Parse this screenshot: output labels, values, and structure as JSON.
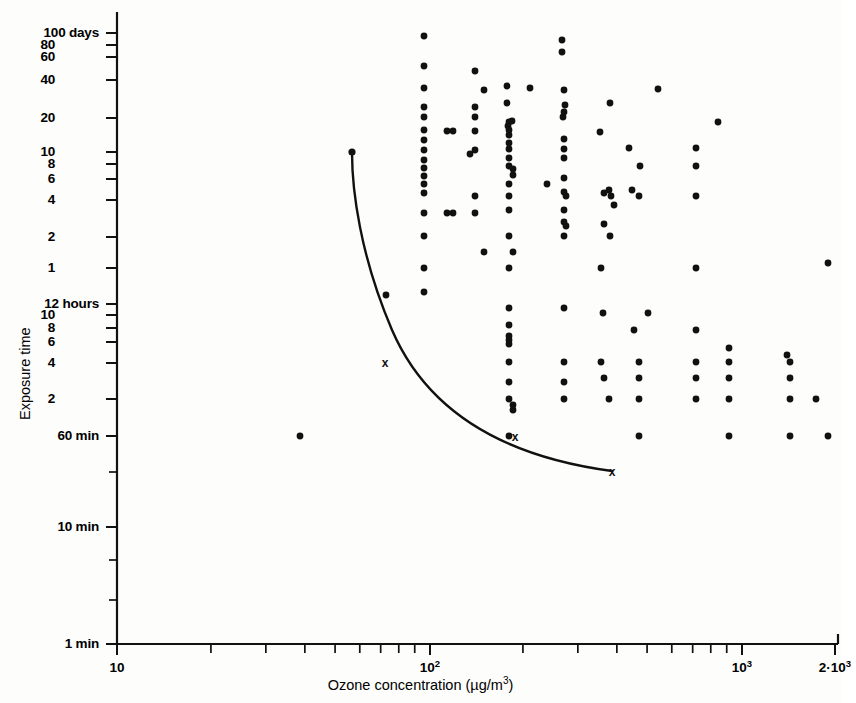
{
  "chart_data": {
    "type": "scatter",
    "title": "",
    "xlabel": "Ozone concentration (µg/m³)",
    "ylabel": "Exposure time",
    "x_scale": "log",
    "y_scale": "log",
    "xlim": [
      10,
      2000
    ],
    "grid": false,
    "legend": null,
    "x_tick_labels": [
      {
        "value": 10,
        "text": "10",
        "px": 117
      },
      {
        "value": 100,
        "text": "10",
        "sup": "2",
        "px": 430
      },
      {
        "value": 1000,
        "text": "10",
        "sup": "3",
        "px": 742
      },
      {
        "value": 2000,
        "text": "2·10",
        "sup": "3",
        "px": 835
      }
    ],
    "x_minor_ticks": [
      20,
      30,
      40,
      50,
      60,
      70,
      80,
      90,
      200,
      300,
      400,
      500,
      600,
      700,
      800,
      900,
      2000
    ],
    "y_tick_labels": [
      {
        "text": "100",
        "unit": " days",
        "px": 33
      },
      {
        "text": "80",
        "unit": "",
        "px": 45
      },
      {
        "text": "60",
        "unit": "",
        "px": 57
      },
      {
        "text": "40",
        "unit": "",
        "px": 80
      },
      {
        "text": "20",
        "unit": "",
        "px": 118
      },
      {
        "text": "10",
        "unit": "",
        "px": 152
      },
      {
        "text": "8",
        "unit": "",
        "px": 164
      },
      {
        "text": "6",
        "unit": "",
        "px": 179
      },
      {
        "text": "4",
        "unit": "",
        "px": 200
      },
      {
        "text": "2",
        "unit": "",
        "px": 237
      },
      {
        "text": "1",
        "unit": "",
        "px": 268
      },
      {
        "text": "12",
        "unit": " hours",
        "px": 304
      },
      {
        "text": "10",
        "unit": "",
        "px": 315
      },
      {
        "text": "8",
        "unit": "",
        "px": 328
      },
      {
        "text": "6",
        "unit": "",
        "px": 342
      },
      {
        "text": "4",
        "unit": "",
        "px": 363
      },
      {
        "text": "2",
        "unit": "",
        "px": 399
      },
      {
        "text": "60",
        "unit": " min",
        "px": 436
      },
      {
        "text": "10",
        "unit": " min",
        "px": 527
      },
      {
        "text": "1",
        "unit": " min",
        "px": 644
      }
    ],
    "y_minor_ticks_px": [
      472,
      560,
      600
    ],
    "axes_px": {
      "x_origin": 117,
      "y_bottom": 644,
      "y_top": 12,
      "x_right": 838
    },
    "points_px": [
      [
        424,
        36
      ],
      [
        562,
        40
      ],
      [
        562,
        52
      ],
      [
        424,
        66
      ],
      [
        475,
        71
      ],
      [
        507,
        86
      ],
      [
        424,
        88
      ],
      [
        530,
        88
      ],
      [
        658,
        89
      ],
      [
        484,
        90
      ],
      [
        564,
        90
      ],
      [
        424,
        107
      ],
      [
        475,
        107
      ],
      [
        507,
        103
      ],
      [
        610,
        103
      ],
      [
        565,
        105
      ],
      [
        424,
        117
      ],
      [
        475,
        117
      ],
      [
        563,
        117
      ],
      [
        564,
        112
      ],
      [
        508,
        126
      ],
      [
        509,
        122
      ],
      [
        475,
        131
      ],
      [
        512,
        121
      ],
      [
        424,
        130
      ],
      [
        447,
        131
      ],
      [
        453,
        131
      ],
      [
        509,
        135
      ],
      [
        509,
        130
      ],
      [
        424,
        140
      ],
      [
        509,
        143
      ],
      [
        564,
        139
      ],
      [
        600,
        132
      ],
      [
        718,
        122
      ],
      [
        424,
        150
      ],
      [
        475,
        150
      ],
      [
        509,
        149
      ],
      [
        564,
        149
      ],
      [
        629,
        148
      ],
      [
        696,
        148
      ],
      [
        424,
        160
      ],
      [
        424,
        168
      ],
      [
        424,
        176
      ],
      [
        424,
        184
      ],
      [
        470,
        154
      ],
      [
        509,
        158
      ],
      [
        564,
        158
      ],
      [
        509,
        166
      ],
      [
        513,
        169
      ],
      [
        513,
        175
      ],
      [
        509,
        184
      ],
      [
        564,
        178
      ],
      [
        640,
        166
      ],
      [
        696,
        166
      ],
      [
        424,
        193
      ],
      [
        475,
        196
      ],
      [
        509,
        196
      ],
      [
        564,
        192
      ],
      [
        609,
        190
      ],
      [
        604,
        193
      ],
      [
        632,
        190
      ],
      [
        547,
        184
      ],
      [
        566,
        196
      ],
      [
        611,
        196
      ],
      [
        639,
        196
      ],
      [
        696,
        196
      ],
      [
        424,
        213
      ],
      [
        509,
        210
      ],
      [
        564,
        210
      ],
      [
        614,
        205
      ],
      [
        424,
        236
      ],
      [
        509,
        236
      ],
      [
        564,
        236
      ],
      [
        424,
        268
      ],
      [
        509,
        268
      ],
      [
        601,
        268
      ],
      [
        696,
        268
      ],
      [
        828,
        263
      ],
      [
        424,
        292
      ],
      [
        386,
        295
      ],
      [
        509,
        308
      ],
      [
        564,
        308
      ],
      [
        603,
        313
      ],
      [
        648,
        313
      ],
      [
        509,
        325
      ],
      [
        509,
        336
      ],
      [
        509,
        340
      ],
      [
        509,
        344
      ],
      [
        634,
        330
      ],
      [
        696,
        330
      ],
      [
        509,
        362
      ],
      [
        564,
        362
      ],
      [
        601,
        362
      ],
      [
        639,
        362
      ],
      [
        696,
        362
      ],
      [
        729,
        348
      ],
      [
        729,
        362
      ],
      [
        787,
        355
      ],
      [
        790,
        362
      ],
      [
        509,
        382
      ],
      [
        564,
        382
      ],
      [
        604,
        378
      ],
      [
        639,
        378
      ],
      [
        696,
        378
      ],
      [
        729,
        378
      ],
      [
        790,
        378
      ],
      [
        509,
        399
      ],
      [
        564,
        399
      ],
      [
        609,
        399
      ],
      [
        639,
        399
      ],
      [
        696,
        399
      ],
      [
        729,
        399
      ],
      [
        790,
        399
      ],
      [
        816,
        399
      ],
      [
        300,
        436
      ],
      [
        509,
        436
      ],
      [
        639,
        436
      ],
      [
        729,
        436
      ],
      [
        790,
        436
      ],
      [
        828,
        436
      ],
      [
        513,
        405
      ],
      [
        513,
        410
      ],
      [
        475,
        213
      ],
      [
        453,
        213
      ],
      [
        447,
        213
      ],
      [
        564,
        222
      ],
      [
        566,
        226
      ],
      [
        610,
        236
      ],
      [
        604,
        224
      ],
      [
        484,
        252
      ],
      [
        513,
        252
      ]
    ],
    "threshold_curve": {
      "label": "threshold curve",
      "start_px": [
        352,
        152
      ],
      "end_px": [
        612,
        471
      ],
      "path": "M 352,152 C 352,190 360,255 392,330 C 424,404 492,455 612,471",
      "markers_px": [
        [
          352,
          152
        ],
        [
          385,
          362
        ],
        [
          515,
          436
        ],
        [
          612,
          471
        ]
      ],
      "marker_symbols": [
        "dot",
        "x",
        "x",
        "x"
      ]
    },
    "colors": {
      "axis": "#111111",
      "point": "#111111",
      "curve": "#111111",
      "background": "#fdfdfc"
    }
  },
  "axis_titles": {
    "x_main": "Ozone concentration (",
    "x_unit_pre": "µg/m",
    "x_unit_sup": "3",
    "x_close": ")",
    "y": "Exposure time"
  }
}
